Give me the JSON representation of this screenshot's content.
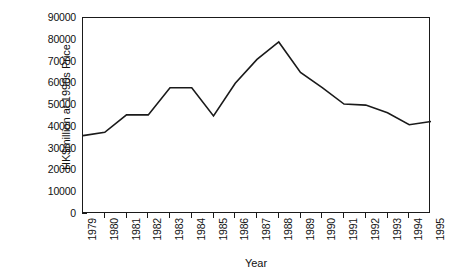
{
  "chart_data": {
    "type": "line",
    "title": "",
    "xlabel": "Year",
    "ylabel": "HK$million at 1990s Price",
    "categories": [
      "1979",
      "1980",
      "1981",
      "1982",
      "1983",
      "1984",
      "1985",
      "1986",
      "1987",
      "1988",
      "1989",
      "1990",
      "1991",
      "1992",
      "1993",
      "1994",
      "1995"
    ],
    "values": [
      36000,
      37500,
      45500,
      45500,
      58000,
      58000,
      45000,
      60000,
      71000,
      79000,
      65000,
      58000,
      50500,
      50000,
      46500,
      41000,
      42500
    ],
    "series": [
      {
        "name": "HK$million at 1990s Price",
        "values": [
          36000,
          37500,
          45500,
          45500,
          58000,
          58000,
          45000,
          60000,
          71000,
          79000,
          65000,
          58000,
          50500,
          50000,
          46500,
          41000,
          42500
        ]
      }
    ],
    "ylim": [
      0,
      90000
    ],
    "yticks": [
      0,
      10000,
      20000,
      30000,
      40000,
      50000,
      60000,
      70000,
      80000,
      90000
    ],
    "ytick_labels": [
      "0",
      "10000",
      "20000",
      "30000",
      "40000",
      "50000",
      "60000",
      "70000",
      "80000",
      "90000"
    ],
    "grid": false,
    "legend": null,
    "legend_position": "none",
    "line_color": "#1a1a1a",
    "axis_color": "#1a1a1a",
    "background_color": "#ffffff"
  }
}
